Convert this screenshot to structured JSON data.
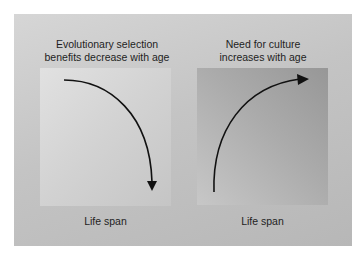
{
  "diagram": {
    "panels": [
      {
        "id": "left",
        "title_lines": [
          "Evolutionary selection",
          "benefits decrease with age"
        ],
        "axis_label": "Life span",
        "arrow_direction": "decreasing",
        "box_gradient": [
          "#e1e1e1",
          "#c5c5c5"
        ]
      },
      {
        "id": "right",
        "title_lines": [
          "Need for culture",
          "increases with age"
        ],
        "axis_label": "Life span",
        "arrow_direction": "increasing",
        "box_gradient": [
          "#979797",
          "#c7c7c7"
        ]
      }
    ],
    "colors": {
      "background": "#ffffff",
      "outer_panel": "#c4c4c4",
      "arrow": "#111111",
      "text": "#1e1e1e"
    }
  }
}
